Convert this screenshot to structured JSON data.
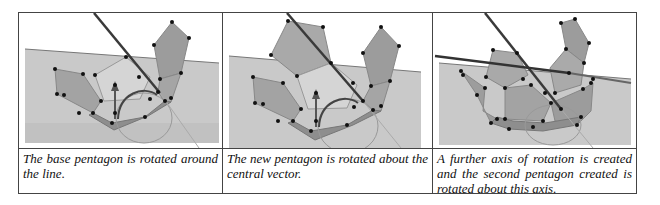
{
  "table": {
    "columns": [
      {
        "image": {
          "description": "3D view: base pentagon with attached pentagons, rotation axis line and central vector arrow",
          "colors": {
            "plane": "#c8c8c8",
            "pentagon": "#a9a9a9",
            "line": "#3a3a3a",
            "point": "#111111"
          }
        },
        "caption": "The base pentagon is rotated around the line."
      },
      {
        "image": {
          "description": "3D view: new pentagon rotated about the central vector",
          "colors": {
            "plane": "#c8c8c8",
            "pentagon": "#a9a9a9",
            "line": "#3a3a3a",
            "point": "#111111"
          }
        },
        "caption": "The new pentagon is rotated about the central vector."
      },
      {
        "image": {
          "description": "3D view: further axis of rotation with second pentagon rotated",
          "colors": {
            "plane": "#c8c8c8",
            "pentagon": "#a9a9a9",
            "line": "#3a3a3a",
            "point": "#111111"
          }
        },
        "caption": "A further axis of rotation is created and the second pentagon created is rotated about this axis."
      }
    ]
  }
}
